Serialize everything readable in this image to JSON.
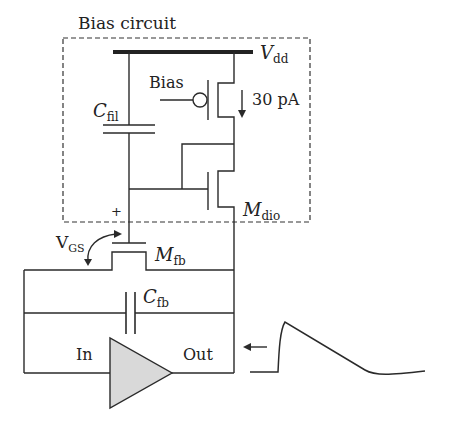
{
  "diagram": {
    "title": "Bias circuit",
    "supply": {
      "symbol": "V",
      "subscript": "dd"
    },
    "bias_input_label": "Bias",
    "current_label": "30 pA",
    "capacitors": {
      "filter": {
        "symbol": "C",
        "subscript": "fil"
      },
      "feedback": {
        "symbol": "C",
        "subscript": "fb"
      }
    },
    "transistors": {
      "diode": {
        "symbol": "M",
        "subscript": "dio"
      },
      "feedback": {
        "symbol": "M",
        "subscript": "fb"
      }
    },
    "vgs": {
      "symbol": "V",
      "subscript": "GS",
      "polarity": "+"
    },
    "amplifier": {
      "input_label": "In",
      "output_label": "Out",
      "fill": "#d9d9d9"
    },
    "line_color": "#2a2a2a"
  }
}
